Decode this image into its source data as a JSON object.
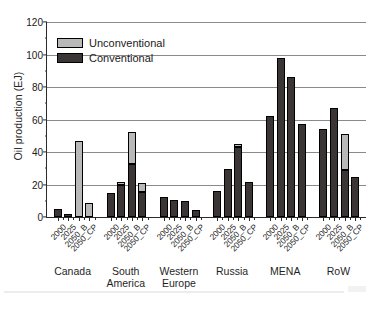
{
  "chart_data": {
    "type": "bar",
    "title": "",
    "xlabel": "",
    "ylabel": "Oil production (EJ)",
    "ylim": [
      0,
      120
    ],
    "ytick_values": [
      0,
      20,
      40,
      60,
      80,
      100,
      120
    ],
    "ytick_labels": [
      "0",
      "20",
      "40",
      "60",
      "80",
      "100",
      "120"
    ],
    "grid": "horizontal",
    "stacked": true,
    "legend_position": "upper-left-inside",
    "scenarios": [
      "2000",
      "2025",
      "2050_B",
      "2050_CP"
    ],
    "groups": [
      "Canada",
      "South America",
      "Western Europe",
      "Russia",
      "MENA",
      "RoW"
    ],
    "group_labels_display": [
      "Canada",
      "South\nAmerica",
      "Western\nEurope",
      "Russia",
      "MENA",
      "RoW"
    ],
    "series": [
      {
        "name": "Conventional",
        "color": "#3b3536",
        "values": [
          [
            5.0,
            2.0,
            0.0,
            0.0
          ],
          [
            14.5,
            19.5,
            32.5,
            15.5
          ],
          [
            12.5,
            10.5,
            10.0,
            4.5
          ],
          [
            16.0,
            29.5,
            43.0,
            21.5
          ],
          [
            62.0,
            98.0,
            86.0,
            57.5
          ],
          [
            54.0,
            67.0,
            29.0,
            24.5
          ]
        ]
      },
      {
        "name": "Unconventional",
        "color": "#b9b9b9",
        "values": [
          [
            0.0,
            0.0,
            47.0,
            8.5
          ],
          [
            0.0,
            2.0,
            20.0,
            5.5
          ],
          [
            0.0,
            0.0,
            0.0,
            0.0
          ],
          [
            0.0,
            0.0,
            2.0,
            0.0
          ],
          [
            0.0,
            0.0,
            0.0,
            0.0
          ],
          [
            0.0,
            0.0,
            22.0,
            0.0
          ]
        ]
      }
    ],
    "totals": [
      [
        5.0,
        2.0,
        47.0,
        8.5
      ],
      [
        14.5,
        21.5,
        52.5,
        21.0
      ],
      [
        12.5,
        10.5,
        10.0,
        4.5
      ],
      [
        16.0,
        29.5,
        45.0,
        21.5
      ],
      [
        62.0,
        98.0,
        86.0,
        57.5
      ],
      [
        54.0,
        67.0,
        51.0,
        24.5
      ]
    ],
    "legend": [
      {
        "label": "Unconventional",
        "color": "#b9b9b9"
      },
      {
        "label": "Conventional",
        "color": "#3b3536"
      }
    ]
  }
}
